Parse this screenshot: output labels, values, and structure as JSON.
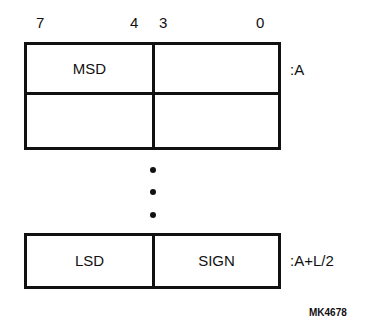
{
  "bit_labels": [
    "7",
    "4",
    "3",
    "0"
  ],
  "rows": [
    {
      "high_nibble": "MSD",
      "low_nibble": "",
      "address": ":A"
    },
    {
      "high_nibble": "",
      "low_nibble": "",
      "address": ""
    },
    {
      "high_nibble": "LSD",
      "low_nibble": "SIGN",
      "address": ":A+L/2"
    }
  ],
  "ellipsis": "⋮",
  "figure_id": "MK4678"
}
